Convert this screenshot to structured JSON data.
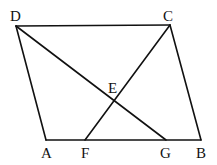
{
  "figure": {
    "type": "geometry",
    "points": [
      {
        "name": "A",
        "label": "A"
      },
      {
        "name": "B",
        "label": "B"
      },
      {
        "name": "C",
        "label": "C"
      },
      {
        "name": "D",
        "label": "D"
      },
      {
        "name": "E",
        "label": "E"
      },
      {
        "name": "F",
        "label": "F"
      },
      {
        "name": "G",
        "label": "G"
      }
    ],
    "segments": [
      {
        "from": "A",
        "to": "B"
      },
      {
        "from": "B",
        "to": "C"
      },
      {
        "from": "C",
        "to": "D"
      },
      {
        "from": "D",
        "to": "A"
      },
      {
        "from": "D",
        "to": "G"
      },
      {
        "from": "C",
        "to": "F"
      }
    ]
  }
}
